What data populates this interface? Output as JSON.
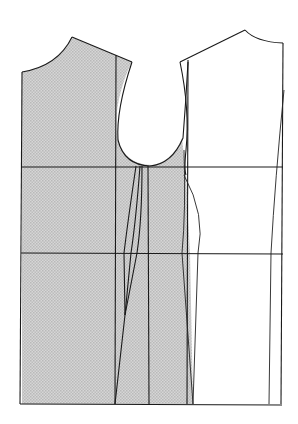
{
  "diagram": {
    "type": "bodice-pattern-draft",
    "panels": [
      {
        "name": "back-bodice",
        "shaded": true
      },
      {
        "name": "front-bodice",
        "shaded": false
      }
    ],
    "guide_lines": [
      "chest-line",
      "waist-line",
      "hem-line"
    ],
    "colors": {
      "line": "#1a1a1a",
      "shade": "#cfcfcf",
      "background": "#ffffff"
    }
  }
}
